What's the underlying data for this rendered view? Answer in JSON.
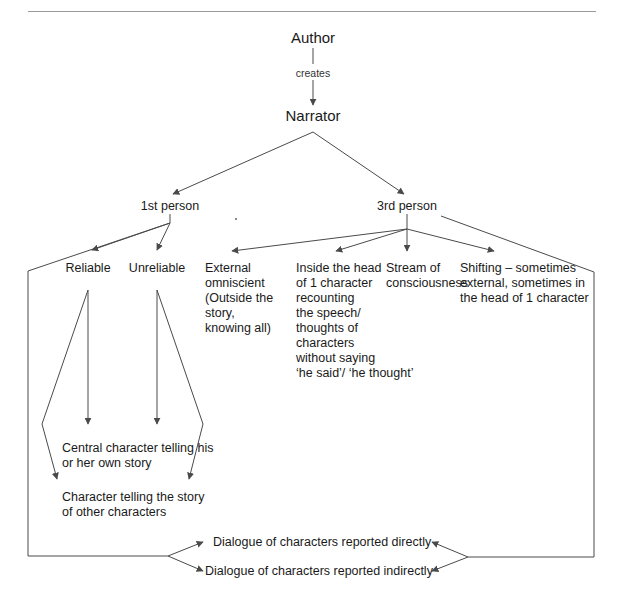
{
  "diagram": {
    "title_rule": "horizontal-rule",
    "line_color": "#4a4a4a",
    "text_color": "#1a1a1a",
    "background": "#ffffff",
    "nodes": {
      "author": "Author",
      "creates": "creates",
      "narrator": "Narrator",
      "first_person": "1st person",
      "third_person": "3rd person",
      "reliable": "Reliable",
      "unreliable": "Unreliable",
      "external_omniscient": "External\nomniscient\n(Outside the\nstory,\nknowing all)",
      "inside_head": "Inside the head\nof 1 character\nrecounting\nthe speech/\nthoughts of\ncharacters\nwithout saying\n‘he said’/ ‘he thought’",
      "stream_of_consciousness": "Stream of\nconsciousness",
      "shifting": "Shifting – sometimes\nexternal, sometimes in\nthe head of 1 character",
      "central_character": "Central character telling his\nor her own story",
      "character_telling": "Character telling the story\nof other characters",
      "dialogue_direct": "Dialogue of characters reported directly",
      "dialogue_indirect": "Dialogue of characters reported indirectly"
    }
  }
}
